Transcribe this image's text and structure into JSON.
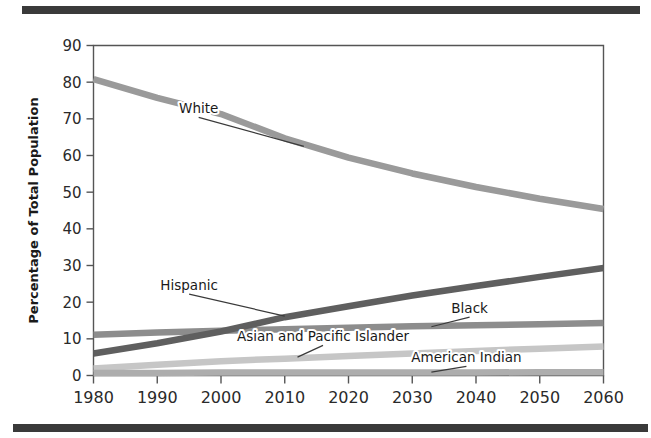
{
  "figure": {
    "top_rule_present": true,
    "bottom_rule_present": true,
    "rule_color": "#3a3a3a",
    "background": "#ffffff"
  },
  "chart_data": {
    "type": "line",
    "title": "",
    "subtitle": "",
    "xlabel": "",
    "ylabel": "Percentage of Total Population",
    "xlim": [
      1980,
      2060
    ],
    "ylim": [
      0,
      90
    ],
    "grid": false,
    "legend_position": "inline-labels",
    "x_ticks": [
      "1980",
      "1990",
      "2000",
      "2010",
      "2020",
      "2030",
      "2040",
      "2050",
      "2060"
    ],
    "y_ticks": [
      "0",
      "10",
      "20",
      "30",
      "40",
      "50",
      "60",
      "70",
      "80",
      "90"
    ],
    "x": [
      1980,
      1990,
      2000,
      2010,
      2020,
      2030,
      2040,
      2050,
      2060
    ],
    "series": [
      {
        "name": "White",
        "color": "#9a9a9a",
        "values": [
          80.8,
          75.7,
          71.3,
          64.7,
          59.4,
          55.1,
          51.4,
          48.2,
          45.4
        ],
        "label": "White",
        "label_x": 1996.5,
        "label_y": 71.5,
        "leader_to_x": 2013,
        "leader_to_y": 62.5
      },
      {
        "name": "Hispanic",
        "color": "#5f5f5f",
        "values": [
          6.0,
          8.8,
          12.0,
          15.9,
          18.9,
          21.8,
          24.4,
          26.9,
          29.3
        ],
        "label": "Hispanic",
        "label_x": 1995.0,
        "label_y": 23.3,
        "leader_to_x": 2010,
        "leader_to_y": 16.2
      },
      {
        "name": "Black",
        "color": "#8d8d8d",
        "values": [
          11.1,
          11.7,
          12.2,
          12.6,
          13.0,
          13.4,
          13.7,
          14.0,
          14.3
        ],
        "label": "Black",
        "label_x": 2039.0,
        "label_y": 17.0,
        "leader_to_x": 2033,
        "leader_to_y": 13.3
      },
      {
        "name": "Asian and Pacific Islander",
        "color": "#c6c6c6",
        "values": [
          1.9,
          2.9,
          3.9,
          4.6,
          5.3,
          6.0,
          6.7,
          7.3,
          7.9
        ],
        "label": "Asian and Pacific Islander",
        "label_x": 2016.0,
        "label_y": 9.3,
        "leader_to_x": 2012,
        "leader_to_y": 5.0
      },
      {
        "name": "American Indian",
        "color": "#adadad",
        "values": [
          0.7,
          0.7,
          0.8,
          0.8,
          0.8,
          0.8,
          0.8,
          0.9,
          0.9
        ],
        "label": "American Indian",
        "label_x": 2038.5,
        "label_y": 3.6,
        "leader_to_x": 2033,
        "leader_to_y": 0.9
      }
    ]
  }
}
